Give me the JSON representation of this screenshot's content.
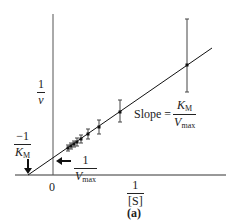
{
  "chart_data": {
    "type": "scatter",
    "title": "",
    "subtitle": "",
    "caption": "(a)",
    "xlabel": "1/[S]",
    "ylabel": "1/v",
    "x_tick_labels": [
      "0"
    ],
    "grid": false,
    "legend": null,
    "series": [
      {
        "name": "Lineweaver-Burk data",
        "points_px": [
          {
            "x": 68,
            "y": 148,
            "err_top": 145,
            "err_bottom": 151
          },
          {
            "x": 71,
            "y": 146,
            "err_top": 143,
            "err_bottom": 149
          },
          {
            "x": 74,
            "y": 144,
            "err_top": 141,
            "err_bottom": 147
          },
          {
            "x": 77,
            "y": 142,
            "err_top": 138,
            "err_bottom": 146
          },
          {
            "x": 81,
            "y": 139,
            "err_top": 135,
            "err_bottom": 143
          },
          {
            "x": 88,
            "y": 134,
            "err_top": 129,
            "err_bottom": 139
          },
          {
            "x": 99,
            "y": 127,
            "err_top": 120,
            "err_bottom": 134
          },
          {
            "x": 120,
            "y": 112,
            "err_top": 100,
            "err_bottom": 122
          },
          {
            "x": 187,
            "y": 65,
            "err_top": 19,
            "err_bottom": 92
          }
        ]
      }
    ],
    "fit_line": {
      "x1": 28,
      "y1": 175,
      "x2": 212,
      "y2": 48
    },
    "annotations": {
      "slope": {
        "prefix": "Slope =",
        "numerator": "K",
        "numerator_sub": "M",
        "denominator": "V",
        "denominator_sub": "max"
      },
      "y_intercept": {
        "numerator": "1",
        "denominator": "V",
        "denominator_sub": "max"
      },
      "x_intercept": {
        "numerator": "−1",
        "denominator": "K",
        "denominator_sub": "M"
      }
    }
  },
  "labels": {
    "y_axis_num": "1",
    "y_axis_den": "v",
    "x_axis_num": "1",
    "x_axis_den": "[S]",
    "zero": "0",
    "caption": "(a)",
    "slope_prefix": "Slope =",
    "slope_num": "K",
    "slope_num_sub": "M",
    "slope_den": "V",
    "slope_den_sub": "max",
    "yint_num": "1",
    "yint_den": "V",
    "yint_den_sub": "max",
    "xint_num": "−1",
    "xint_den": "K",
    "xint_den_sub": "M"
  }
}
